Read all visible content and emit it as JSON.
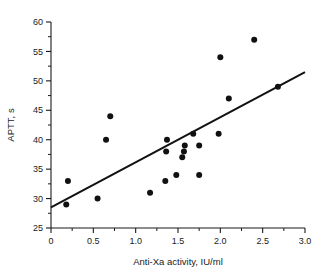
{
  "chart_data": {
    "type": "scatter",
    "title": "",
    "xlabel": "Anti-Xa activity, IU/ml",
    "ylabel": "APTT, s",
    "xlim": [
      0,
      3.0
    ],
    "ylim": [
      25,
      60
    ],
    "grid": false,
    "legend": "none",
    "x_ticks": [
      "0",
      "0.5",
      "1.0",
      "1.5",
      "2.0",
      "2.5",
      "3.0"
    ],
    "x_tick_values": [
      0,
      0.5,
      1.0,
      1.5,
      2.0,
      2.5,
      3.0
    ],
    "x_minor_step": 0.25,
    "y_ticks": [
      "25",
      "30",
      "35",
      "40",
      "45",
      "50",
      "55",
      "60"
    ],
    "y_tick_values": [
      25,
      30,
      35,
      40,
      45,
      50,
      55,
      60
    ],
    "y_minor_step": 2.5,
    "marker": "filled-circle",
    "marker_color": "#111111",
    "points": [
      {
        "x": 0.18,
        "y": 29
      },
      {
        "x": 0.2,
        "y": 33
      },
      {
        "x": 0.55,
        "y": 30
      },
      {
        "x": 0.65,
        "y": 40
      },
      {
        "x": 0.7,
        "y": 44
      },
      {
        "x": 1.17,
        "y": 31
      },
      {
        "x": 1.35,
        "y": 33
      },
      {
        "x": 1.36,
        "y": 38
      },
      {
        "x": 1.37,
        "y": 40
      },
      {
        "x": 1.48,
        "y": 34
      },
      {
        "x": 1.55,
        "y": 37
      },
      {
        "x": 1.57,
        "y": 38
      },
      {
        "x": 1.58,
        "y": 39
      },
      {
        "x": 1.68,
        "y": 41
      },
      {
        "x": 1.75,
        "y": 34
      },
      {
        "x": 1.75,
        "y": 39
      },
      {
        "x": 1.98,
        "y": 41
      },
      {
        "x": 2.0,
        "y": 54
      },
      {
        "x": 2.1,
        "y": 47
      },
      {
        "x": 2.4,
        "y": 57
      },
      {
        "x": 2.68,
        "y": 49
      }
    ],
    "fit_line": {
      "type": "line",
      "name": "regression-line",
      "color": "#111111",
      "x_start": 0.0,
      "y_start": 28.5,
      "x_end": 3.0,
      "y_end": 51.5
    }
  }
}
